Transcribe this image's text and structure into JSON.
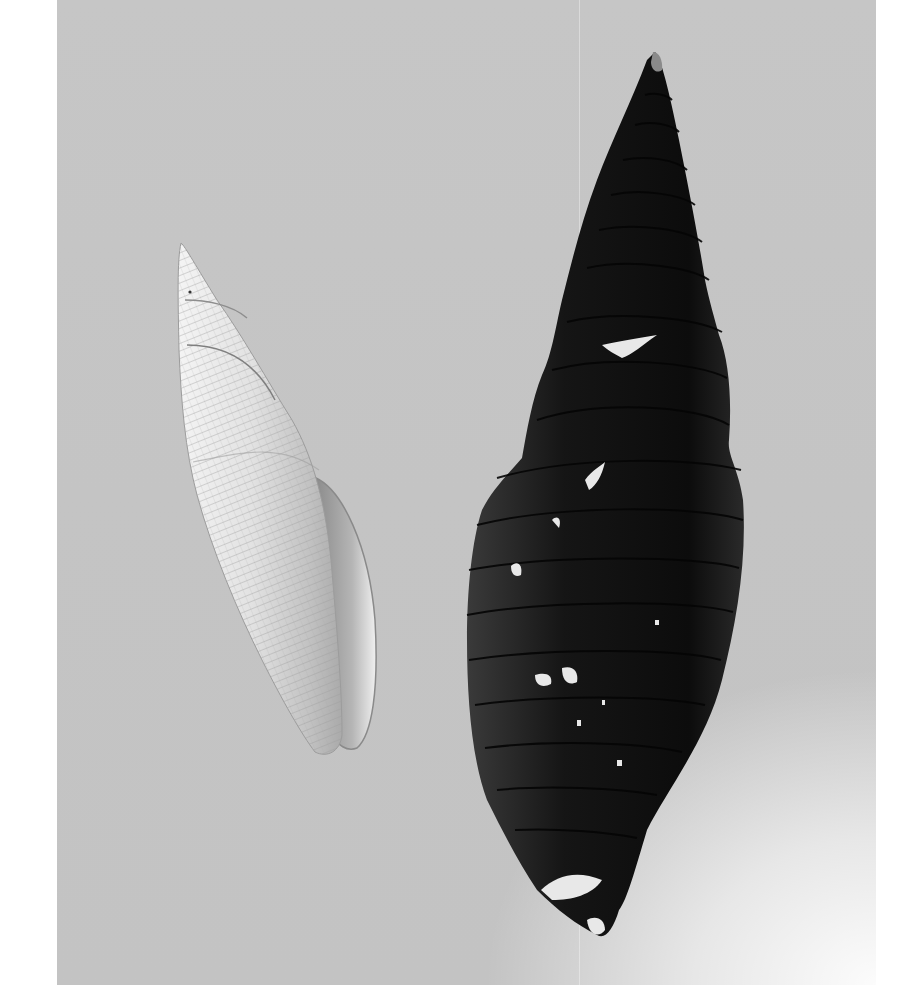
{
  "image": {
    "subject": "Two elongated spiral seashells on a gray photographic background",
    "background_color": "#c5c5c5",
    "objects": [
      {
        "name": "light-shell",
        "description": "Small pale, finely reticulated (cross-ribbed) fusiform shell with open aperture, tilted to the right",
        "color": "#e6e6e6"
      },
      {
        "name": "dark-shell",
        "description": "Large dark, heavily eroded turreted spiral shell with spiral grooves and white chipped patches",
        "color": "#1a1a1a"
      }
    ]
  }
}
